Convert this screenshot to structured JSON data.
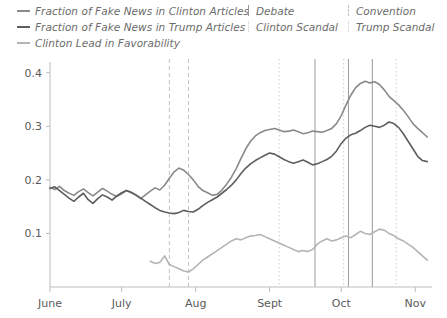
{
  "legend": {
    "series": [
      {
        "label": "Fraction of Fake News in Clinton Articles",
        "color": "#8a8a8a",
        "style": "solid"
      },
      {
        "label": "Fraction of Fake News in Trump Articles",
        "color": "#5d5d5d",
        "style": "solid"
      },
      {
        "label": "Clinton Lead in Favorability",
        "color": "#b4b4b4",
        "style": "solid"
      }
    ],
    "events": [
      {
        "label": "Debate",
        "marker": "solid",
        "color": "#9a9a9a"
      },
      {
        "label": "Clinton Scandal",
        "marker": "dotted",
        "color": "#cccccc"
      },
      {
        "label": "Convention",
        "marker": "dashed",
        "color": "#c2c2c2"
      },
      {
        "label": "Trump Scandal",
        "marker": "dotted",
        "color": "#cccccc"
      }
    ]
  },
  "chart_data": {
    "type": "line",
    "title": "",
    "xlabel": "",
    "ylabel": "",
    "grid": false,
    "legend_position": "top",
    "ylim": [
      0.0,
      0.42
    ],
    "yticks": [
      0.1,
      0.2,
      0.3,
      0.4
    ],
    "ytick_labels": [
      "0.1",
      "0.2",
      "0.3",
      "0.4"
    ],
    "xlim": [
      0,
      160
    ],
    "xticks": [
      0,
      30,
      61,
      92,
      122,
      153
    ],
    "xtick_labels": [
      "June",
      "July",
      "Aug",
      "Sept",
      "Oct",
      "Nov"
    ],
    "x_unit": "days since June 1",
    "series": [
      {
        "name": "Fraction of Fake News in Clinton Articles",
        "color": "#8a8a8a",
        "x": [
          0,
          2,
          4,
          6,
          8,
          10,
          12,
          14,
          16,
          18,
          20,
          22,
          24,
          26,
          28,
          30,
          32,
          34,
          36,
          38,
          40,
          42,
          44,
          46,
          48,
          50,
          52,
          54,
          56,
          58,
          60,
          62,
          64,
          66,
          68,
          70,
          72,
          74,
          76,
          78,
          80,
          82,
          84,
          86,
          88,
          90,
          92,
          94,
          96,
          98,
          100,
          102,
          104,
          106,
          108,
          110,
          112,
          114,
          116,
          118,
          120,
          122,
          124,
          126,
          128,
          130,
          132,
          134,
          136,
          138,
          140,
          142,
          144,
          146,
          148,
          150,
          152,
          154,
          156,
          158
        ],
        "y": [
          0.186,
          0.182,
          0.188,
          0.18,
          0.175,
          0.171,
          0.178,
          0.183,
          0.176,
          0.17,
          0.177,
          0.184,
          0.179,
          0.173,
          0.169,
          0.174,
          0.18,
          0.176,
          0.171,
          0.165,
          0.172,
          0.179,
          0.185,
          0.181,
          0.19,
          0.203,
          0.215,
          0.222,
          0.218,
          0.21,
          0.2,
          0.188,
          0.18,
          0.176,
          0.171,
          0.173,
          0.181,
          0.192,
          0.205,
          0.221,
          0.24,
          0.258,
          0.272,
          0.282,
          0.288,
          0.292,
          0.294,
          0.296,
          0.293,
          0.29,
          0.291,
          0.293,
          0.29,
          0.286,
          0.288,
          0.291,
          0.29,
          0.289,
          0.292,
          0.296,
          0.305,
          0.32,
          0.34,
          0.358,
          0.372,
          0.38,
          0.384,
          0.381,
          0.383,
          0.378,
          0.368,
          0.356,
          0.348,
          0.34,
          0.33,
          0.318,
          0.305,
          0.296,
          0.288,
          0.28
        ]
      },
      {
        "name": "Fraction of Fake News in Trump Articles",
        "color": "#5d5d5d",
        "x": [
          0,
          2,
          4,
          6,
          8,
          10,
          12,
          14,
          16,
          18,
          20,
          22,
          24,
          26,
          28,
          30,
          32,
          34,
          36,
          38,
          40,
          42,
          44,
          46,
          48,
          50,
          52,
          54,
          56,
          58,
          60,
          62,
          64,
          66,
          68,
          70,
          72,
          74,
          76,
          78,
          80,
          82,
          84,
          86,
          88,
          90,
          92,
          94,
          96,
          98,
          100,
          102,
          104,
          106,
          108,
          110,
          112,
          114,
          116,
          118,
          120,
          122,
          124,
          126,
          128,
          130,
          132,
          134,
          136,
          138,
          140,
          142,
          144,
          146,
          148,
          150,
          152,
          154,
          156,
          158
        ],
        "y": [
          0.184,
          0.187,
          0.18,
          0.173,
          0.166,
          0.16,
          0.168,
          0.175,
          0.163,
          0.156,
          0.165,
          0.172,
          0.168,
          0.162,
          0.17,
          0.176,
          0.18,
          0.177,
          0.172,
          0.166,
          0.16,
          0.154,
          0.148,
          0.143,
          0.14,
          0.138,
          0.137,
          0.139,
          0.143,
          0.141,
          0.14,
          0.145,
          0.152,
          0.158,
          0.163,
          0.168,
          0.175,
          0.182,
          0.19,
          0.2,
          0.212,
          0.222,
          0.23,
          0.236,
          0.241,
          0.246,
          0.25,
          0.248,
          0.243,
          0.238,
          0.234,
          0.231,
          0.234,
          0.237,
          0.233,
          0.228,
          0.23,
          0.234,
          0.238,
          0.244,
          0.254,
          0.268,
          0.278,
          0.284,
          0.287,
          0.292,
          0.298,
          0.302,
          0.3,
          0.298,
          0.302,
          0.308,
          0.305,
          0.298,
          0.286,
          0.272,
          0.258,
          0.244,
          0.236,
          0.234
        ]
      },
      {
        "name": "Clinton Lead in Favorability",
        "color": "#b4b4b4",
        "x": [
          42,
          44,
          46,
          48,
          50,
          52,
          54,
          56,
          58,
          60,
          62,
          64,
          66,
          68,
          70,
          72,
          74,
          76,
          78,
          80,
          82,
          84,
          86,
          88,
          90,
          92,
          94,
          96,
          98,
          100,
          102,
          104,
          106,
          108,
          110,
          112,
          114,
          116,
          118,
          120,
          122,
          124,
          126,
          128,
          130,
          132,
          134,
          136,
          138,
          140,
          142,
          144,
          146,
          148,
          150,
          152,
          154,
          156,
          158
        ],
        "y": [
          0.048,
          0.044,
          0.046,
          0.058,
          0.042,
          0.038,
          0.034,
          0.03,
          0.028,
          0.034,
          0.042,
          0.05,
          0.056,
          0.062,
          0.068,
          0.074,
          0.08,
          0.086,
          0.09,
          0.088,
          0.092,
          0.095,
          0.096,
          0.098,
          0.094,
          0.09,
          0.086,
          0.082,
          0.078,
          0.074,
          0.07,
          0.066,
          0.068,
          0.066,
          0.07,
          0.08,
          0.086,
          0.09,
          0.086,
          0.088,
          0.092,
          0.095,
          0.092,
          0.098,
          0.104,
          0.1,
          0.098,
          0.103,
          0.108,
          0.106,
          0.1,
          0.096,
          0.09,
          0.086,
          0.08,
          0.074,
          0.066,
          0.058,
          0.05
        ]
      }
    ],
    "event_lines": [
      {
        "label": "Convention",
        "x": 50,
        "marker": "dashed",
        "color": "#c2c2c2"
      },
      {
        "label": "Convention",
        "x": 58,
        "marker": "dashed",
        "color": "#c2c2c2"
      },
      {
        "label": "Clinton Scandal",
        "x": 96,
        "marker": "dotted",
        "color": "#cccccc"
      },
      {
        "label": "Debate",
        "x": 111,
        "marker": "solid",
        "color": "#9a9a9a"
      },
      {
        "label": "Clinton Scandal",
        "x": 123,
        "marker": "dotted",
        "color": "#cccccc"
      },
      {
        "label": "Debate",
        "x": 125,
        "marker": "solid",
        "color": "#9a9a9a"
      },
      {
        "label": "Debate",
        "x": 135,
        "marker": "solid",
        "color": "#9a9a9a"
      },
      {
        "label": "Trump Scandal",
        "x": 145,
        "marker": "dotted",
        "color": "#cccccc"
      }
    ]
  }
}
